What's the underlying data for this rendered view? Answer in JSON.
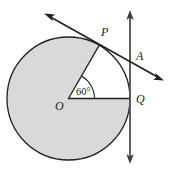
{
  "figure": {
    "type": "geometry-diagram",
    "background_color": "#ffffff",
    "stroke_color": "#231f20",
    "shaded_fill_color": "#d9d9d9",
    "unshaded_fill_color": "#ffffff",
    "labels": {
      "center": "O",
      "tangent_point_upper": "P",
      "tangent_point_right": "Q",
      "intersection": "A",
      "central_angle": "60°"
    },
    "circle": {
      "center_x": 68.5,
      "center_y": 98.5,
      "radius": 61.5
    },
    "points": {
      "O": {
        "x": 68.5,
        "y": 98.5
      },
      "P": {
        "x": 99.3,
        "y": 45.2
      },
      "Q": {
        "x": 130.0,
        "y": 98.5
      },
      "A": {
        "x": 130.0,
        "y": 63.0
      }
    },
    "label_positions": {
      "O": {
        "x": 58,
        "y": 109
      },
      "P": {
        "x": 101,
        "y": 36
      },
      "Q": {
        "x": 136,
        "y": 103
      },
      "A": {
        "x": 136,
        "y": 60
      },
      "angle": {
        "x": 77,
        "y": 95
      }
    },
    "segments": [
      {
        "name": "radius-OP",
        "x1": 68.5,
        "y1": 98.5,
        "x2": 99.3,
        "y2": 45.2
      },
      {
        "name": "radius-OQ",
        "x1": 68.5,
        "y1": 98.5,
        "x2": 130.0,
        "y2": 98.5
      }
    ],
    "tangent_line_at_P": {
      "name": "tangent-line-through-P",
      "x1": 45.0,
      "y1": 14.0,
      "x2": 163.0,
      "y2": 80.0,
      "double_headed": true
    },
    "tangent_line_at_Q": {
      "name": "tangent-line-through-Q",
      "x1": 130.0,
      "y1": 11.0,
      "x2": 130.0,
      "y2": 163.0,
      "double_headed": true
    },
    "angle_arc": {
      "name": "central-angle-arc",
      "vertex": "O",
      "measure_degrees": 60,
      "arc_radius": 26
    }
  }
}
